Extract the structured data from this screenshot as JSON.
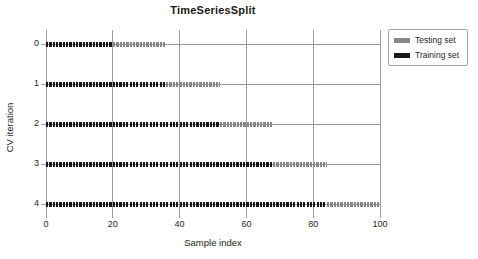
{
  "chart_data": {
    "type": "scatter",
    "title": "TimeSeriesSplit",
    "xlabel": "Sample index",
    "ylabel": "CV iteration",
    "xlim": [
      0,
      100
    ],
    "n_samples": 100,
    "x_ticks": [
      0,
      20,
      40,
      60,
      80,
      100
    ],
    "y_tick_labels": [
      "0",
      "1",
      "2",
      "3",
      "4"
    ],
    "grid": true,
    "marker": "horizontal-dash",
    "legend": {
      "position": "outside-upper-right",
      "entries": [
        {
          "label": "Testing set",
          "color": "#8a8684"
        },
        {
          "label": "Training set",
          "color": "#17171e"
        }
      ]
    },
    "series": [
      {
        "cv_iteration": 0,
        "train": [
          0,
          20
        ],
        "test": [
          20,
          36
        ]
      },
      {
        "cv_iteration": 1,
        "train": [
          0,
          36
        ],
        "test": [
          36,
          52
        ]
      },
      {
        "cv_iteration": 2,
        "train": [
          0,
          52
        ],
        "test": [
          52,
          68
        ]
      },
      {
        "cv_iteration": 3,
        "train": [
          0,
          68
        ],
        "test": [
          68,
          84
        ]
      },
      {
        "cv_iteration": 4,
        "train": [
          0,
          84
        ],
        "test": [
          84,
          100
        ]
      }
    ],
    "colors": {
      "testing": "#8a8684",
      "training": "#17171e",
      "grid": "#999999",
      "text": "#262626",
      "background": "#ffffff"
    }
  }
}
